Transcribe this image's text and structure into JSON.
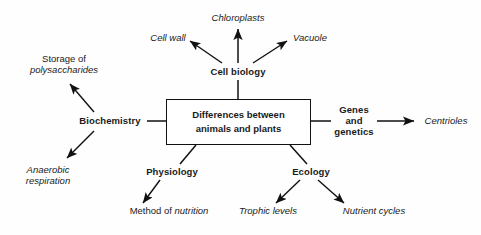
{
  "diagram": {
    "center": {
      "line1": "Differences between",
      "line2": "animals and plants"
    },
    "branches": {
      "cell_biology": {
        "label": "Cell biology",
        "leaves": [
          {
            "label": "Cell wall"
          },
          {
            "label": "Chloroplasts"
          },
          {
            "label": "Vacuole"
          }
        ]
      },
      "biochemistry": {
        "label": "Biochemistry",
        "leaves": [
          {
            "line1": "Storage of",
            "line2": "polysaccharides"
          },
          {
            "line1": "Anaerobic",
            "line2": "respiration"
          }
        ]
      },
      "genes_and_genetics": {
        "line1": "Genes",
        "line2": "and",
        "line3": "genetics",
        "leaves": [
          {
            "label": "Centrioles"
          }
        ]
      },
      "physiology": {
        "label": "Physiology",
        "leaves": [
          {
            "prefix": "Method of ",
            "emphasis": "nutrition"
          }
        ]
      },
      "ecology": {
        "label": "Ecology",
        "leaves": [
          {
            "label": "Trophic levels"
          },
          {
            "label": "Nutrient cycles"
          }
        ]
      }
    },
    "colors": {
      "ink": "#1a1a1a",
      "stroke": "#111111",
      "background": "#fefefe"
    }
  }
}
